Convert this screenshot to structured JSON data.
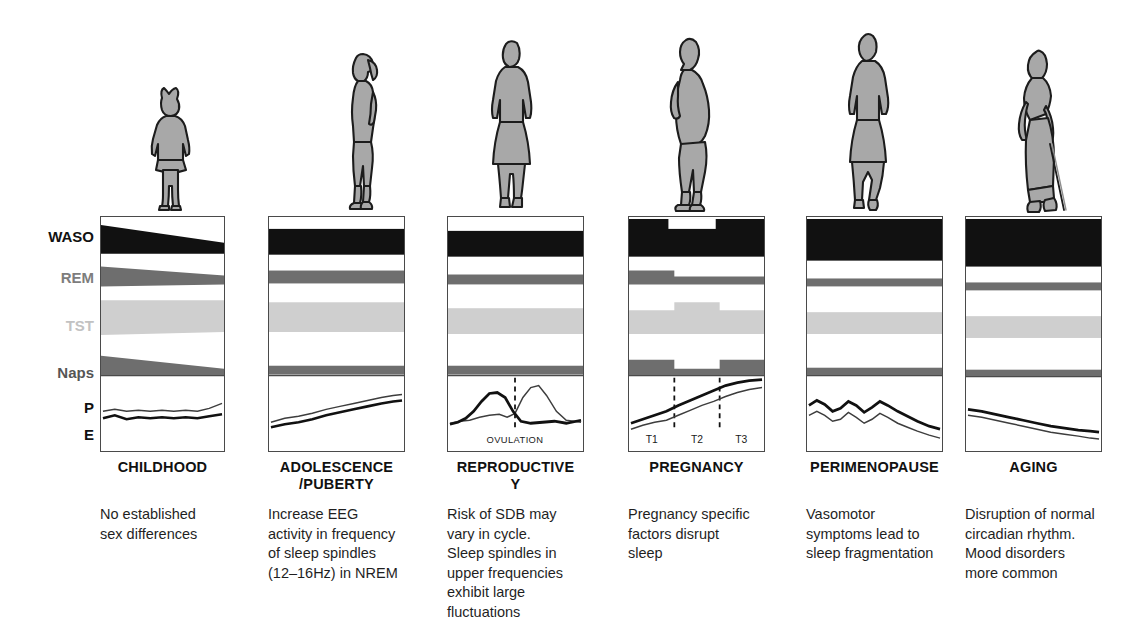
{
  "row_labels": [
    {
      "id": "waso",
      "text": "WASO"
    },
    {
      "id": "rem",
      "text": "REM"
    },
    {
      "id": "tst",
      "text": "TST"
    },
    {
      "id": "naps",
      "text": "Naps"
    },
    {
      "id": "p",
      "text": "P"
    },
    {
      "id": "e",
      "text": "E"
    }
  ],
  "stages": [
    {
      "id": "childhood",
      "title": "CHILDHOOD",
      "caption": "No established\nsex differences",
      "figure": "girl-child-dress",
      "annotations": []
    },
    {
      "id": "adolescence",
      "title": "ADOLESCENCE\n/PUBERTY",
      "caption": "Increase EEG\nactivity in frequency\nof sleep spindles\n(12–16Hz) in NREM",
      "figure": "teen-girl-profile",
      "annotations": []
    },
    {
      "id": "reproductive",
      "title": "REPRODUCTIVE\nY",
      "caption": "Risk of SDB may\nvary in cycle.\nSleep spindles in\nupper frequencies\nexhibit large\nfluctuations",
      "figure": "adult-woman-dress",
      "annotations": [
        "OVULATION"
      ]
    },
    {
      "id": "pregnancy",
      "title": "PREGNANCY",
      "caption": "Pregnancy specific\nfactors disrupt\nsleep",
      "figure": "pregnant-woman-profile",
      "annotations": [
        "T1",
        "T2",
        "T3"
      ]
    },
    {
      "id": "perimenopause",
      "title": "PERIMENOPAUSE",
      "caption": "Vasomotor\nsymptoms lead to\nsleep fragmentation",
      "figure": "mature-woman-walking",
      "annotations": []
    },
    {
      "id": "aging",
      "title": "AGING",
      "caption": "Disruption of normal\ncircadian rhythm.\nMood disorders\nmore common",
      "figure": "elderly-woman-cane",
      "annotations": []
    }
  ],
  "colors": {
    "waso": "#111111",
    "rem": "#6e6e6e",
    "tst": "#cfcfcf",
    "naps": "#6e6e6e",
    "progesterone_line": "#111111",
    "estrogen_line": "#3d3d3d",
    "panel_border": "#4a4a4a",
    "figure_fill": "#a8a8a8",
    "figure_outline": "#1c1c1c"
  },
  "chart_data": {
    "type": "area",
    "xlabel": "",
    "ylabel": "",
    "categories": [
      "CHILDHOOD",
      "ADOLESCENCE/PUBERTY",
      "REPRODUCTIVE Y",
      "PREGNANCY",
      "PERIMENOPAUSE",
      "AGING"
    ],
    "measures": [
      "WASO",
      "REM",
      "TST",
      "Naps",
      "P",
      "E"
    ],
    "legend_position": "left-axis-labels",
    "grid": false,
    "series": [
      {
        "name": "WASO",
        "description": "Wake after sleep onset band thickness, relative units 0-10",
        "values": [
          3.0,
          3.4,
          3.8,
          7.0,
          8.5,
          9.0
        ],
        "notes": "Tapers from thick to thin within childhood; pregnancy band has a white notch over T2; thickest in perimenopause and aging"
      },
      {
        "name": "REM",
        "description": "REM sleep band thickness, relative units 0-10",
        "values": [
          3.0,
          2.2,
          1.6,
          2.2,
          1.3,
          1.3
        ],
        "notes": "Childhood band tapers downward left to right; pregnancy steps down after T1"
      },
      {
        "name": "TST",
        "description": "Total sleep time band thickness, relative units 0-10",
        "values": [
          6.5,
          6.0,
          5.2,
          5.6,
          4.4,
          4.2
        ],
        "notes": "Pregnancy band is elevated during T1-T2 then steps down in T3"
      },
      {
        "name": "Naps",
        "description": "Daytime napping band thickness, relative units 0-10",
        "values": [
          4.0,
          1.2,
          1.2,
          3.2,
          1.2,
          1.2
        ],
        "notes": "Highest and tapering in childhood; pregnancy shows raised T1 and T3 with a dip in T2"
      },
      {
        "name": "P",
        "description": "Progesterone trajectory within each life stage",
        "values": [
          1.0,
          3.5,
          5.0,
          8.5,
          5.0,
          1.5
        ],
        "notes": "Flat and low in childhood; rising in adolescence; peaks after ovulation in reproductive years; steadily climbs through pregnancy; fluctuates then declines in perimenopause; low and falling in aging"
      },
      {
        "name": "E",
        "description": "Estrogen trajectory within each life stage",
        "values": [
          1.2,
          3.8,
          5.2,
          7.8,
          4.2,
          1.2
        ],
        "notes": "Peaks just before ovulation in reproductive years; rises through pregnancy; oscillates in perimenopause; declines in aging"
      }
    ],
    "reproductive_cycle": {
      "marker": "OVULATION",
      "marker_position_fraction": 0.5,
      "estrogen_peak_before_ovulation": true,
      "progesterone_peak_after_ovulation": true
    },
    "pregnancy_trimesters": {
      "labels": [
        "T1",
        "T2",
        "T3"
      ],
      "boundaries_fraction": [
        0.333,
        0.666
      ]
    }
  }
}
